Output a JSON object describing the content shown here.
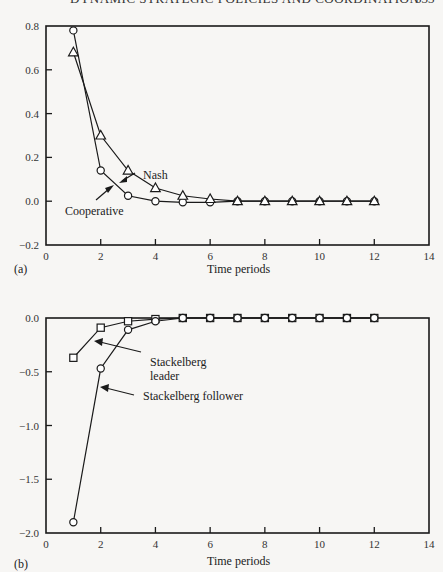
{
  "page": {
    "running_header": "DYNAMIC STRATEGIC POLICIES AND COORDINATION",
    "page_number": "333"
  },
  "chart_data": [
    {
      "panel": "(a)",
      "type": "line",
      "title": "",
      "xlabel": "Time periods",
      "ylabel": "",
      "xlim": [
        0,
        14
      ],
      "ylim": [
        -0.2,
        0.8
      ],
      "xticks": [
        0,
        2,
        4,
        6,
        8,
        10,
        12,
        14
      ],
      "yticks": [
        0.8,
        0.6,
        0.4,
        0.2,
        0.0,
        -0.2
      ],
      "ytick_labels": [
        "0.8",
        "0.6",
        "0.4",
        "0.2",
        "0.0",
        "−0.2"
      ],
      "grid": false,
      "x": [
        1,
        2,
        3,
        4,
        5,
        6,
        7,
        8,
        9,
        10,
        11,
        12
      ],
      "series": [
        {
          "name": "Cooperative",
          "marker": "circle",
          "values": [
            0.78,
            0.14,
            0.025,
            0.0,
            -0.005,
            -0.005,
            0.0,
            0.0,
            0.0,
            0.0,
            0.0,
            0.0
          ]
        },
        {
          "name": "Nash",
          "marker": "triangle",
          "values": [
            0.68,
            0.3,
            0.14,
            0.06,
            0.025,
            0.01,
            0.0,
            0.0,
            0.0,
            0.0,
            0.0,
            0.0
          ]
        }
      ],
      "annotations": [
        {
          "text": "Nash",
          "series": "Nash"
        },
        {
          "text": "Cooperative",
          "series": "Cooperative"
        }
      ]
    },
    {
      "panel": "(b)",
      "type": "line",
      "title": "",
      "xlabel": "Time periods",
      "ylabel": "",
      "xlim": [
        0,
        14
      ],
      "ylim": [
        -2.0,
        0.0
      ],
      "xticks": [
        0,
        2,
        4,
        6,
        8,
        10,
        12,
        14
      ],
      "yticks": [
        0.0,
        -0.5,
        -1.0,
        -1.5,
        -2.0
      ],
      "ytick_labels": [
        "0.0",
        "−0.5",
        "−1.0",
        "−1.5",
        "−2.0"
      ],
      "grid": false,
      "x": [
        1,
        2,
        3,
        4,
        5,
        6,
        7,
        8,
        9,
        10,
        11,
        12
      ],
      "series": [
        {
          "name": "Stackelberg leader",
          "marker": "square",
          "values": [
            -0.37,
            -0.09,
            -0.03,
            -0.01,
            0.0,
            0.0,
            0.0,
            0.0,
            0.0,
            0.0,
            0.0,
            0.0
          ]
        },
        {
          "name": "Stackelberg follower",
          "marker": "circle",
          "values": [
            -1.9,
            -0.47,
            -0.11,
            -0.03,
            0.0,
            0.0,
            0.0,
            0.0,
            0.0,
            0.0,
            0.0,
            0.0
          ]
        }
      ],
      "annotations": [
        {
          "text": "Stackelberg",
          "text2": "leader",
          "series": "Stackelberg leader"
        },
        {
          "text": "Stackelberg follower",
          "series": "Stackelberg follower"
        }
      ]
    }
  ]
}
